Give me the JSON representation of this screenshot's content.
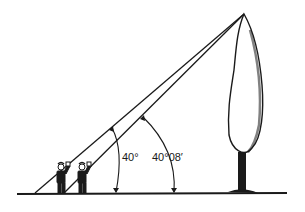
{
  "diagram": {
    "labels": {
      "angle_near": "40°",
      "angle_far": "40°08′"
    },
    "colors": {
      "ink": "#1a1a1a",
      "background": "#ffffff"
    }
  }
}
